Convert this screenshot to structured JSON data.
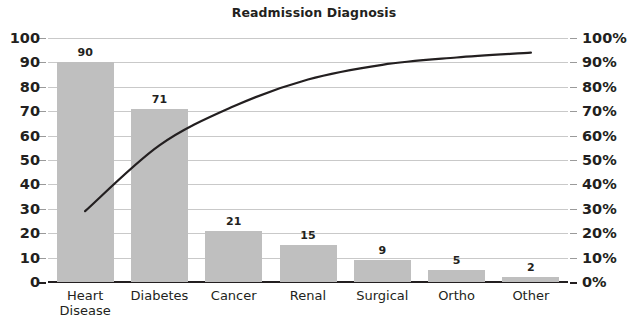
{
  "chart_data": {
    "type": "bar",
    "title": "Readmission Diagnosis",
    "xlabel": "",
    "ylabel": "",
    "categories": [
      "Heart Disease",
      "Diabetes",
      "Cancer",
      "Renal",
      "Surgical",
      "Ortho",
      "Other"
    ],
    "values": [
      90,
      71,
      21,
      15,
      9,
      5,
      2
    ],
    "value_labels": [
      "90",
      "71",
      "21",
      "15",
      "9",
      "5",
      "2"
    ],
    "ylim": [
      0,
      100
    ],
    "yticks": [
      0,
      10,
      20,
      30,
      40,
      50,
      60,
      70,
      80,
      90,
      100
    ],
    "ytick_labels": [
      "0",
      "10",
      "20",
      "30",
      "40",
      "50",
      "60",
      "70",
      "80",
      "90",
      "100"
    ],
    "secondary_axis": {
      "ylim": [
        0,
        100
      ],
      "yticks": [
        0,
        10,
        20,
        30,
        40,
        50,
        60,
        70,
        80,
        90,
        100
      ],
      "ytick_labels": [
        "0%",
        "10%",
        "20%",
        "30%",
        "40%",
        "50%",
        "60%",
        "70%",
        "80%",
        "90%",
        "100%"
      ]
    },
    "series": [
      {
        "name": "Count",
        "type": "bar",
        "values": [
          90,
          71,
          21,
          15,
          9,
          5,
          2
        ],
        "color": "#bfbfbf"
      },
      {
        "name": "Cumulative %",
        "type": "line",
        "axis": "secondary",
        "values": [
          42.5,
          76.0,
          85.8,
          92.9,
          97.2,
          99.5,
          100.0
        ],
        "plotted_percent": [
          29,
          56,
          72,
          83,
          89,
          92,
          94
        ],
        "color": "#231f20"
      }
    ],
    "grid": true,
    "legend": "none"
  },
  "axis": {
    "left_labels": [
      "100",
      "90",
      "80",
      "70",
      "60",
      "50",
      "40",
      "30",
      "20",
      "10",
      "0"
    ],
    "right_labels": [
      "100%",
      "90%",
      "80%",
      "70%",
      "60%",
      "50%",
      "40%",
      "30%",
      "20%",
      "10%",
      "0%"
    ]
  }
}
